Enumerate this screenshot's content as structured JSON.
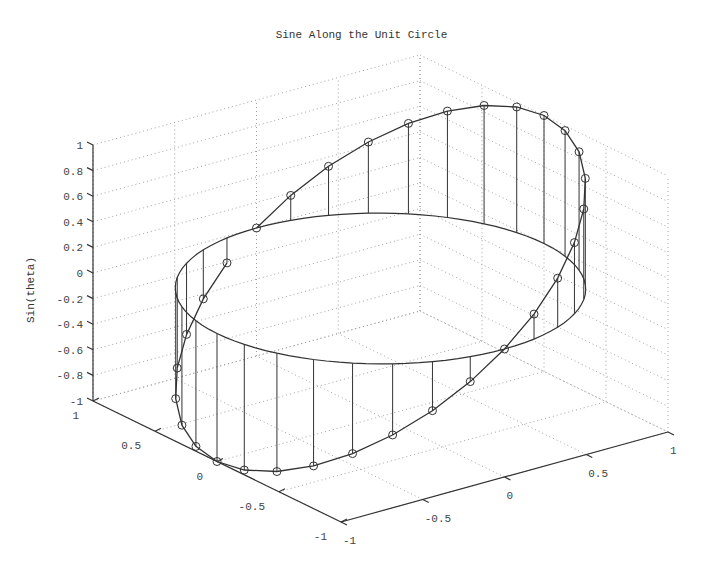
{
  "chart_data": {
    "type": "line3d",
    "title": "Sine Along the Unit Circle",
    "xlabel": "",
    "ylabel": "",
    "zlabel": "Sin(theta)",
    "xlim": [
      -1,
      1
    ],
    "ylim": [
      -1,
      1
    ],
    "zlim": [
      -1,
      1
    ],
    "grid": true,
    "marker": "circle",
    "stems": true,
    "reference_circle_z": 0,
    "x_ticks": [
      "-1",
      "-0.5",
      "0",
      "0.5",
      "1"
    ],
    "y_ticks": [
      "-1",
      "-0.5",
      "0",
      "0.5",
      "1"
    ],
    "z_ticks": [
      "-1",
      "-0.8",
      "-0.6",
      "-0.4",
      "-0.2",
      "0",
      "0.2",
      "0.4",
      "0.6",
      "0.8",
      "1"
    ],
    "points": {
      "theta_deg": [
        0,
        11.25,
        22.5,
        33.75,
        45,
        56.25,
        67.5,
        78.75,
        90,
        101.25,
        112.5,
        123.75,
        135,
        146.25,
        157.5,
        168.75,
        180,
        191.25,
        202.5,
        213.75,
        225,
        236.25,
        247.5,
        258.75,
        270,
        281.25,
        292.5,
        303.75,
        315,
        326.25,
        337.5,
        348.75
      ],
      "x": [
        0,
        0.195,
        0.383,
        0.556,
        0.707,
        0.831,
        0.924,
        0.981,
        1,
        0.981,
        0.924,
        0.831,
        0.707,
        0.556,
        0.383,
        0.195,
        0,
        -0.195,
        -0.383,
        -0.556,
        -0.707,
        -0.831,
        -0.924,
        -0.981,
        -1,
        -0.981,
        -0.924,
        -0.831,
        -0.707,
        -0.556,
        -0.383,
        -0.195
      ],
      "y": [
        1,
        0.981,
        0.924,
        0.831,
        0.707,
        0.556,
        0.383,
        0.195,
        0,
        -0.195,
        -0.383,
        -0.556,
        -0.707,
        -0.831,
        -0.924,
        -0.981,
        -1,
        -0.981,
        -0.924,
        -0.831,
        -0.707,
        -0.556,
        -0.383,
        -0.195,
        0,
        0.195,
        0.383,
        0.556,
        0.707,
        0.831,
        0.924,
        0.981
      ],
      "z": [
        0,
        0.195,
        0.383,
        0.556,
        0.707,
        0.831,
        0.924,
        0.981,
        1,
        0.981,
        0.924,
        0.831,
        0.707,
        0.556,
        0.383,
        0.195,
        0,
        -0.195,
        -0.383,
        -0.556,
        -0.707,
        -0.831,
        -0.924,
        -0.981,
        -1,
        -0.981,
        -0.924,
        -0.831,
        -0.707,
        -0.556,
        -0.383,
        -0.195
      ]
    },
    "projection": {
      "origin_corner_px": [
        341,
        522
      ],
      "x_axis_vec_px": [
        327,
        -90
      ],
      "y_axis_vec_px": [
        -248,
        -121
      ],
      "z_axis_vec_px": [
        0,
        -256
      ]
    },
    "colors": {
      "line": "#333333",
      "grid": "#999999",
      "axis": "#333333",
      "text": "#444444"
    }
  }
}
